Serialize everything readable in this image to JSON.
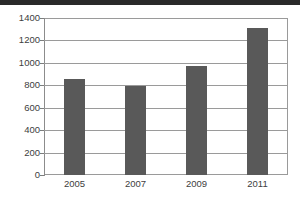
{
  "chart_data": {
    "type": "bar",
    "title": "",
    "xlabel": "",
    "ylabel": "",
    "categories": [
      "2005",
      "2007",
      "2009",
      "2011"
    ],
    "values": [
      855,
      790,
      970,
      1310
    ],
    "ylim": [
      0,
      1400
    ],
    "yticks": [
      0,
      200,
      400,
      600,
      800,
      1000,
      1200,
      1400
    ],
    "ytick_labels": [
      "0",
      "200",
      "400",
      "600",
      "800",
      "1000",
      "1200",
      "1400"
    ],
    "grid": true,
    "grid_axis": "y",
    "legend": false,
    "legend_position": "none",
    "bar_color": "#595959",
    "frame_color": "#9a9a9a",
    "background_color": "#ffffff"
  },
  "scan_artifact": {
    "top_band_color": "#2a2a2a"
  }
}
